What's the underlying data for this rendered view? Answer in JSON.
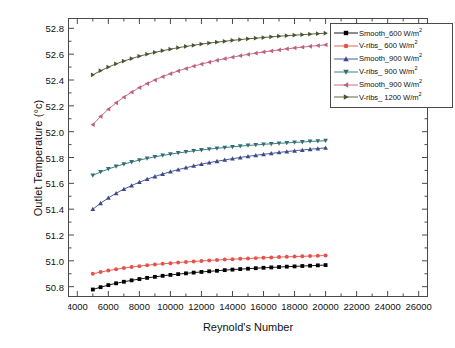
{
  "chart_data": {
    "type": "line",
    "title": "",
    "xlabel": "Reynold's Number",
    "ylabel": "Outlet Temperature (°c)",
    "xlim": [
      3400,
      26600
    ],
    "ylim": [
      50.72,
      52.88
    ],
    "xticks": [
      4000,
      6000,
      8000,
      10000,
      12000,
      14000,
      16000,
      18000,
      20000,
      22000,
      24000,
      26000
    ],
    "xtick_labels": [
      "4000",
      "6000",
      "8000",
      "10000",
      "12000",
      "14000",
      "16000",
      "18000",
      "20000",
      "22000",
      "24000",
      "26000"
    ],
    "yticks": [
      50.8,
      51.0,
      51.2,
      51.4,
      51.6,
      51.8,
      52.0,
      52.2,
      52.4,
      52.6,
      52.8
    ],
    "ytick_labels": [
      "50.8",
      "51.0",
      "51.2",
      "51.4",
      "51.6",
      "51.8",
      "52.0",
      "52.2",
      "52.4",
      "52.6",
      "52.8"
    ],
    "grid": false,
    "minor_ticks": true,
    "legend_position": "top-right",
    "x": [
      5000,
      5500,
      6000,
      6500,
      7000,
      7500,
      8000,
      8500,
      9000,
      9500,
      10000,
      10500,
      11000,
      11500,
      12000,
      12500,
      13000,
      13500,
      14000,
      14500,
      15000,
      15500,
      16000,
      16500,
      17000,
      17500,
      18000,
      18500,
      19000,
      19500,
      20000
    ],
    "series": [
      {
        "name": "Smooth_600 W/m²",
        "label_main": "Smooth_600 W/m",
        "label_sup": "2",
        "color": "#000000",
        "marker": "square",
        "values": [
          50.778,
          50.796,
          50.812,
          50.826,
          50.838,
          50.849,
          50.859,
          50.868,
          50.876,
          50.884,
          50.891,
          50.897,
          50.903,
          50.909,
          50.914,
          50.919,
          50.923,
          50.928,
          50.932,
          50.936,
          50.939,
          50.943,
          50.946,
          50.949,
          50.952,
          50.955,
          50.957,
          50.96,
          50.962,
          50.965,
          50.967
        ]
      },
      {
        "name": "V-ribs_ 600 W/m²",
        "label_main": "V-ribs_ 600 W/m",
        "label_sup": "2",
        "color": "#e8504a",
        "marker": "circle",
        "values": [
          50.9,
          50.913,
          50.925,
          50.935,
          50.944,
          50.952,
          50.959,
          50.966,
          50.972,
          50.977,
          50.982,
          50.987,
          50.991,
          50.995,
          50.999,
          51.003,
          51.006,
          51.01,
          51.013,
          51.016,
          51.018,
          51.021,
          51.024,
          51.026,
          51.029,
          51.031,
          51.033,
          51.035,
          51.037,
          51.039,
          51.041
        ]
      },
      {
        "name": "Smooth_900 W/m²",
        "label_main": "Smooth_900 W/m",
        "label_sup": "2",
        "color": "#3b4a8c",
        "marker": "triangle-up",
        "values": [
          51.4,
          51.446,
          51.487,
          51.523,
          51.555,
          51.583,
          51.609,
          51.632,
          51.653,
          51.672,
          51.69,
          51.706,
          51.721,
          51.735,
          51.748,
          51.76,
          51.771,
          51.781,
          51.791,
          51.8,
          51.809,
          51.817,
          51.825,
          51.832,
          51.839,
          51.846,
          51.852,
          51.858,
          51.864,
          51.869,
          51.875
        ]
      },
      {
        "name": "V-ribs_ 900 W/m²",
        "label_main": "V-ribs_ 900 W/m",
        "label_sup": "2",
        "color": "#2f6f74",
        "marker": "triangle-down",
        "values": [
          51.662,
          51.688,
          51.711,
          51.731,
          51.749,
          51.765,
          51.78,
          51.793,
          51.805,
          51.816,
          51.826,
          51.835,
          51.843,
          51.851,
          51.858,
          51.865,
          51.871,
          51.877,
          51.883,
          51.888,
          51.893,
          51.897,
          51.902,
          51.906,
          51.91,
          51.913,
          51.917,
          51.92,
          51.924,
          51.927,
          51.93
        ]
      },
      {
        "name": "Smooth_900 W/m²",
        "label_main": "Smooth_900 W/m",
        "label_sup": "2",
        "color": "#c0607e",
        "marker": "triangle-left",
        "values": [
          52.055,
          52.118,
          52.174,
          52.223,
          52.267,
          52.306,
          52.341,
          52.372,
          52.4,
          52.426,
          52.449,
          52.47,
          52.489,
          52.507,
          52.523,
          52.538,
          52.552,
          52.565,
          52.577,
          52.588,
          52.598,
          52.608,
          52.617,
          52.625,
          52.633,
          52.641,
          52.648,
          52.654,
          52.661,
          52.667,
          52.672
        ]
      },
      {
        "name": "V-ribs_ 1200 W/m²",
        "label_main": "V-ribs_ 1200 W/m",
        "label_sup": "2",
        "color": "#4a5530",
        "marker": "triangle-right",
        "values": [
          52.44,
          52.472,
          52.5,
          52.525,
          52.547,
          52.566,
          52.584,
          52.6,
          52.614,
          52.627,
          52.639,
          52.65,
          52.66,
          52.669,
          52.678,
          52.686,
          52.693,
          52.7,
          52.707,
          52.713,
          52.719,
          52.724,
          52.729,
          52.734,
          52.739,
          52.743,
          52.747,
          52.751,
          52.755,
          52.759,
          52.762
        ]
      }
    ]
  }
}
